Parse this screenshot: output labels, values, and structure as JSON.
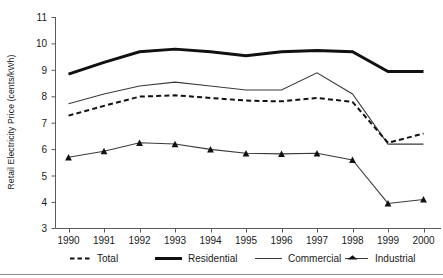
{
  "chart_data": {
    "type": "line",
    "title": "",
    "subtitle": "",
    "xlabel": "",
    "ylabel": "Retail Electricity Price (cents/kWh)",
    "categories": [
      "1990",
      "1991",
      "1992",
      "1993",
      "1994",
      "1995",
      "1996",
      "1997",
      "1998",
      "1999",
      "2000"
    ],
    "x": [
      1990,
      1991,
      1992,
      1993,
      1994,
      1995,
      1996,
      1997,
      1998,
      1999,
      2000
    ],
    "ylim": [
      3,
      11
    ],
    "yticks": [
      3,
      4,
      5,
      6,
      7,
      8,
      9,
      10,
      11
    ],
    "ytick_labels": [
      "3",
      "4",
      "5",
      "6",
      "7",
      "8",
      "9",
      "10",
      "11"
    ],
    "grid": false,
    "legend_position": "bottom",
    "series": [
      {
        "name": "Total",
        "style": "dashed",
        "marker": "none",
        "color": "#111111",
        "values": [
          7.28,
          7.65,
          8.0,
          8.05,
          7.95,
          7.85,
          7.82,
          7.95,
          7.8,
          6.25,
          6.6
        ]
      },
      {
        "name": "Residential",
        "style": "thick-solid",
        "marker": "none",
        "color": "#111111",
        "values": [
          8.85,
          9.3,
          9.7,
          9.8,
          9.7,
          9.55,
          9.7,
          9.75,
          9.7,
          8.95,
          8.95
        ]
      },
      {
        "name": "Commercial",
        "style": "thin-solid",
        "marker": "none",
        "color": "#3a3a3a",
        "values": [
          7.73,
          8.1,
          8.4,
          8.55,
          8.4,
          8.25,
          8.25,
          8.9,
          8.1,
          6.2,
          6.2
        ]
      },
      {
        "name": "Industrial",
        "style": "thin-solid",
        "marker": "triangle",
        "color": "#3a3a3a",
        "values": [
          5.7,
          5.93,
          6.25,
          6.2,
          6.0,
          5.85,
          5.83,
          5.85,
          5.6,
          3.95,
          4.1
        ]
      }
    ]
  },
  "legend": {
    "items": [
      {
        "label": "Total",
        "swatch": "dashed-line-swatch"
      },
      {
        "label": "Residential",
        "swatch": "thick-line-swatch"
      },
      {
        "label": "Commercial",
        "swatch": "thin-line-swatch"
      },
      {
        "label": "Industrial",
        "swatch": "triangle-marker-line-swatch"
      }
    ]
  }
}
